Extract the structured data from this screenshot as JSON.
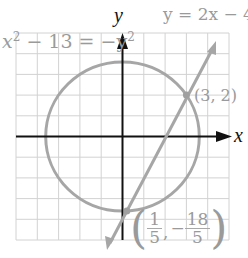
{
  "figure": {
    "x_axis_label": "x",
    "y_axis_label": "y",
    "circle_equation": "x² − 13 = −y²",
    "circle_eq_parts": {
      "pre": "x",
      "sup1": "2",
      "mid": " − 13 = −y",
      "sup2": "2"
    },
    "line_equation": "y = 2x − 4",
    "point_1": {
      "label": "(3, 2)",
      "x": 3,
      "y": 2
    },
    "point_2": {
      "label": "(1/5, −18/5)",
      "x": 0.2,
      "y": -3.6,
      "x_num": "1",
      "x_den": "5",
      "y_sign": "−",
      "y_num": "18",
      "y_den": "5",
      "open_paren": "(",
      "close_paren": ")",
      "comma": ","
    },
    "grid": {
      "xmin": -5,
      "xmax": 5,
      "ymin": -5,
      "ymax": 5,
      "step": 1
    },
    "colors": {
      "grid": "#d0d0d0",
      "axis": "#111111",
      "curve": "#a6a6a6",
      "label": "#9a9a9a"
    }
  }
}
